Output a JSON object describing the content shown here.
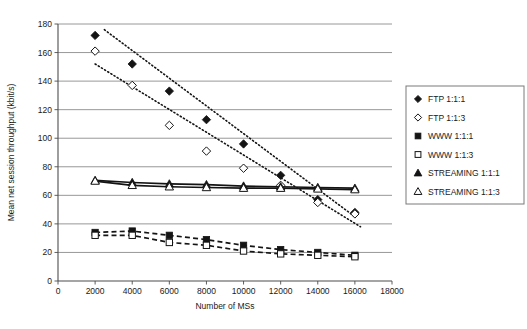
{
  "chart_data": {
    "type": "scatter",
    "title": "",
    "xlabel": "Number of MSs",
    "ylabel": "Mean net session throughput (kbit/s)",
    "xlim": [
      0,
      18000
    ],
    "ylim": [
      0,
      180
    ],
    "xticks": [
      0,
      2000,
      4000,
      6000,
      8000,
      10000,
      12000,
      14000,
      16000,
      18000
    ],
    "yticks": [
      0,
      20,
      40,
      60,
      80,
      100,
      120,
      140,
      160,
      180
    ],
    "grid": "horizontal",
    "legend_position": "right",
    "x": [
      2000,
      4000,
      6000,
      8000,
      10000,
      12000,
      14000,
      16000
    ],
    "series": [
      {
        "name": "FTP 1:1:1",
        "marker": "filled-diamond",
        "line": "dotted-trend",
        "values": [
          172,
          152,
          133,
          113,
          96,
          74,
          57,
          48
        ],
        "trend": [
          [
            2500,
            176
          ],
          [
            16000,
            45
          ]
        ]
      },
      {
        "name": "FTP 1:1:3",
        "marker": "open-diamond",
        "line": "dotted-trend",
        "values": [
          161,
          137,
          109,
          91,
          79,
          67,
          55,
          47
        ],
        "trend": [
          [
            2000,
            152
          ],
          [
            16300,
            38
          ]
        ]
      },
      {
        "name": "WWW 1:1:1",
        "marker": "filled-square",
        "line": "dashed",
        "values": [
          34,
          35,
          32,
          29,
          25,
          22,
          20,
          18
        ]
      },
      {
        "name": "WWW 1:1:3",
        "marker": "open-square",
        "line": "dashed",
        "values": [
          32,
          32,
          27,
          25,
          21,
          19,
          18,
          17
        ]
      },
      {
        "name": "STREAMING 1:1:1",
        "marker": "filled-triangle",
        "line": "solid",
        "values": [
          70.5,
          69,
          68,
          67.5,
          66.5,
          66,
          65.5,
          65
        ]
      },
      {
        "name": "STREAMING 1:1:3",
        "marker": "open-triangle",
        "line": "solid",
        "values": [
          70,
          67,
          66,
          65.5,
          65,
          65,
          64.5,
          64
        ]
      }
    ]
  },
  "legend": {
    "items": [
      {
        "label": "FTP 1:1:1",
        "marker": "filled-diamond"
      },
      {
        "label": "FTP 1:1:3",
        "marker": "open-diamond"
      },
      {
        "label": "WWW 1:1:1",
        "marker": "filled-square"
      },
      {
        "label": "WWW 1:1:3",
        "marker": "open-square"
      },
      {
        "label": "STREAMING 1:1:1",
        "marker": "filled-triangle"
      },
      {
        "label": "STREAMING 1:1:3",
        "marker": "open-triangle"
      }
    ]
  },
  "colors": {
    "series": "#141414",
    "grid": "#8c8c8c",
    "axis": "#4d4d4d",
    "background": "#ffffff",
    "legend_border": "#7a7a7a"
  }
}
